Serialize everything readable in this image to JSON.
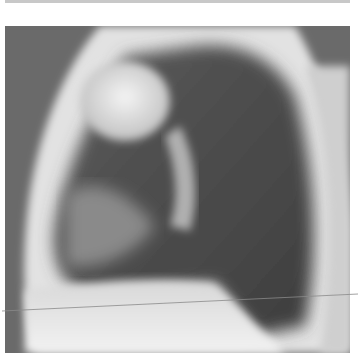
{
  "image": {
    "subject": "Lateral chest radiograph",
    "modality": "X-ray",
    "colors": {
      "background": "#6a6a6a",
      "soft_tissue": "#e6e6e6",
      "lung_field": "#4e4e4e",
      "top_strip": "#c8c8c8",
      "artifact_line": "#8a8a8a"
    }
  }
}
